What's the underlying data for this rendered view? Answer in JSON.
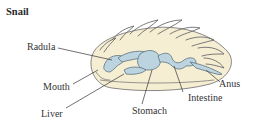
{
  "title": "Snail",
  "labels": {
    "radula": "Radula",
    "mouth": "Mouth",
    "liver": "Liver",
    "stomach": "Stomach",
    "intestine": "Intestine",
    "anus": "Anus"
  },
  "colors": {
    "body_fill": "#f6eed3",
    "outline": "#6b6b6b",
    "gut_fill": "#bcd3e0",
    "gut_outline": "#5d7480",
    "leader": "#333333",
    "text": "#333333"
  }
}
